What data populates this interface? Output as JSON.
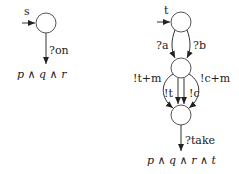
{
  "diagram": {
    "left_automaton": {
      "state_label": "s",
      "transition_label": "?on",
      "final_formula": "p ∧ q ∧ r"
    },
    "right_automaton": {
      "state_label": "t",
      "transition_a": "?a",
      "transition_b": "?b",
      "loop_left": "!t+m",
      "loop_right": "!c+m",
      "edge_t": "!t",
      "edge_c": "!c",
      "transition_take": "?take",
      "final_formula": "p ∧ q ∧ r ∧ t"
    },
    "colors": {
      "stroke": "#333333",
      "text": "#222222"
    }
  }
}
